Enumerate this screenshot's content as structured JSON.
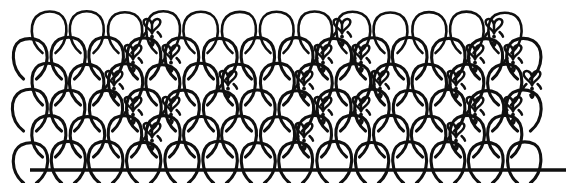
{
  "figure": {
    "canvas": {
      "width": 579,
      "height": 183,
      "background": "#ffffff"
    },
    "ink_color": "#101010",
    "stroke_width": 3.1
  },
  "chart_data": {
    "type": "diagram",
    "geometry": {
      "scale_width": 38,
      "scale_height": 40,
      "row_pitch": 26,
      "pattern_left": 30,
      "pattern_right": 527,
      "baseline_y": 169,
      "row_count": 6,
      "column_count": 14
    },
    "ground_line": {
      "x1": 30,
      "x2": 566,
      "y": 170
    },
    "rows": [
      {
        "index": 0,
        "top_y": 13,
        "offset": 0.5,
        "columns": 13
      },
      {
        "index": 1,
        "top_y": 39,
        "offset": 0.0,
        "columns": 14
      },
      {
        "index": 2,
        "top_y": 65,
        "offset": 0.5,
        "columns": 13
      },
      {
        "index": 3,
        "top_y": 91,
        "offset": 0.0,
        "columns": 14
      },
      {
        "index": 4,
        "top_y": 117,
        "offset": 0.5,
        "columns": 13
      },
      {
        "index": 5,
        "top_y": 143,
        "offset": 0.0,
        "columns": 14
      }
    ],
    "motifs": [
      {
        "row": 0,
        "col": 3,
        "cx": 152,
        "cy": 31
      },
      {
        "row": 0,
        "col": 8,
        "cx": 342,
        "cy": 31
      },
      {
        "row": 0,
        "col": 12,
        "cx": 494,
        "cy": 31
      },
      {
        "row": 1,
        "col": 3,
        "cx": 133,
        "cy": 57
      },
      {
        "row": 1,
        "col": 4,
        "cx": 171,
        "cy": 57
      },
      {
        "row": 1,
        "col": 8,
        "cx": 323,
        "cy": 57
      },
      {
        "row": 1,
        "col": 9,
        "cx": 361,
        "cy": 57
      },
      {
        "row": 1,
        "col": 12,
        "cx": 475,
        "cy": 57
      },
      {
        "row": 1,
        "col": 13,
        "cx": 513,
        "cy": 57
      },
      {
        "row": 2,
        "col": 2,
        "cx": 114,
        "cy": 83
      },
      {
        "row": 2,
        "col": 5,
        "cx": 228,
        "cy": 83
      },
      {
        "row": 2,
        "col": 7,
        "cx": 304,
        "cy": 83
      },
      {
        "row": 2,
        "col": 9,
        "cx": 380,
        "cy": 83
      },
      {
        "row": 2,
        "col": 11,
        "cx": 456,
        "cy": 83
      },
      {
        "row": 2,
        "col": 13,
        "cx": 532,
        "cy": 83
      },
      {
        "row": 3,
        "col": 3,
        "cx": 133,
        "cy": 109
      },
      {
        "row": 3,
        "col": 4,
        "cx": 171,
        "cy": 109
      },
      {
        "row": 3,
        "col": 8,
        "cx": 323,
        "cy": 109
      },
      {
        "row": 3,
        "col": 9,
        "cx": 361,
        "cy": 109
      },
      {
        "row": 3,
        "col": 12,
        "cx": 475,
        "cy": 109
      },
      {
        "row": 3,
        "col": 13,
        "cx": 513,
        "cy": 109
      },
      {
        "row": 4,
        "col": 3,
        "cx": 152,
        "cy": 135
      },
      {
        "row": 4,
        "col": 7,
        "cx": 304,
        "cy": 135
      },
      {
        "row": 4,
        "col": 11,
        "cx": 456,
        "cy": 135
      }
    ],
    "motif_shape": {
      "name": "heart-tulip-pendant",
      "width": 18,
      "height": 26,
      "parts": [
        "twin-lobe-heart",
        "central-stem",
        "two-beads",
        "teardrop-tip"
      ]
    }
  }
}
